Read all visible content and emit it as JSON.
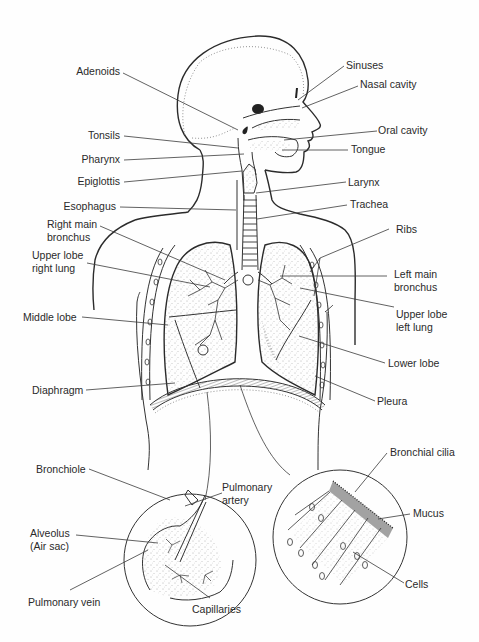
{
  "diagram": {
    "colors": {
      "ink": "#2b2b2b",
      "background": "#fefefe"
    },
    "labels": {
      "adenoids": "Adenoids",
      "sinuses": "Sinuses",
      "nasal_cavity": "Nasal cavity",
      "tonsils": "Tonsils",
      "oral_cavity": "Oral cavity",
      "pharynx": "Pharynx",
      "tongue": "Tongue",
      "epiglottis": "Epiglottis",
      "larynx": "Larynx",
      "esophagus": "Esophagus",
      "trachea": "Trachea",
      "right_main_bronchus_1": "Right main",
      "right_main_bronchus_2": "bronchus",
      "ribs": "Ribs",
      "upper_lobe_right_1": "Upper lobe",
      "upper_lobe_right_2": "right lung",
      "left_main_bronchus_1": "Left main",
      "left_main_bronchus_2": "bronchus",
      "upper_lobe_left_1": "Upper lobe",
      "upper_lobe_left_2": "left lung",
      "middle_lobe": "Middle lobe",
      "lower_lobe": "Lower lobe",
      "diaphragm": "Diaphragm",
      "pleura": "Pleura",
      "bronchiole": "Bronchiole",
      "pulmonary_artery_1": "Pulmonary",
      "pulmonary_artery_2": "artery",
      "alveolus_1": "Alveolus",
      "alveolus_2": "(Air sac)",
      "pulmonary_vein": "Pulmonary vein",
      "capillaries": "Capillaries",
      "bronchial_cilia": "Bronchial cilia",
      "mucus": "Mucus",
      "cells": "Cells"
    },
    "insets": [
      {
        "name": "alveolus-detail",
        "center": [
          190,
          560
        ],
        "radius": 66
      },
      {
        "name": "cilia-detail",
        "center": [
          340,
          537
        ],
        "radius": 67
      }
    ]
  }
}
